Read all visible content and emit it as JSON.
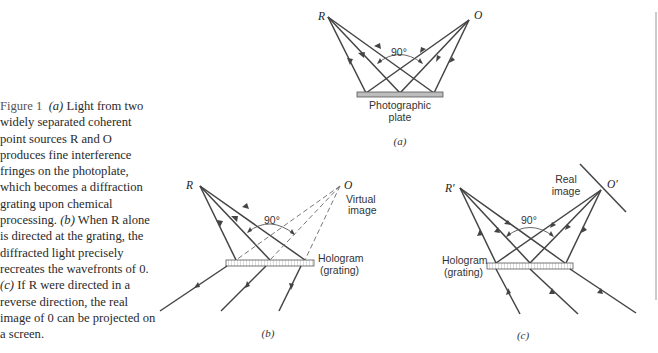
{
  "caption": {
    "figure_label": "Figure 1",
    "part_a_marker": "(a)",
    "part_a_text": " Light from two widely separated coherent point sources R and O produces fine interference fringes on the photoplate, which becomes a diffraction grating upon chemical processing. ",
    "part_b_marker": "(b)",
    "part_b_text": " When R alone is directed at the grating, the diffracted light precisely recreates the wavefronts of 0. ",
    "part_c_marker": "(c)",
    "part_c_text": " If R were directed in a reverse direction, the real image of 0 can be projected on a screen."
  },
  "panel_a": {
    "source_left": "R",
    "source_right": "O",
    "angle": "90°",
    "plate_label_line1": "Photographic",
    "plate_label_line2": "plate",
    "sub_label": "(a)"
  },
  "panel_b": {
    "source_left": "R",
    "source_right": "O",
    "virtual_label_line1": "Virtual",
    "virtual_label_line2": "image",
    "angle": "90°",
    "hologram_label_line1": "Hologram",
    "hologram_label_line2": "(grating)",
    "sub_label": "(b)"
  },
  "panel_c": {
    "source_left": "R′",
    "source_right": "O′",
    "real_label_line1": "Real",
    "real_label_line2": "image",
    "angle": "90°",
    "hologram_label_line1": "Hologram",
    "hologram_label_line2": "(grating)",
    "sub_label": "(c)"
  },
  "colors": {
    "ray": "#444444",
    "plate_fill": "#bdbdbd",
    "hologram_fill": "#ffffff",
    "text": "#2a2a2a"
  }
}
